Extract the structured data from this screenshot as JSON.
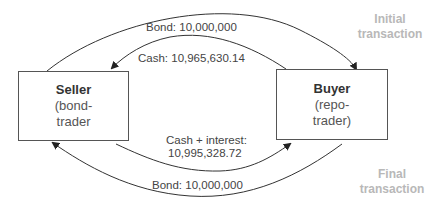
{
  "parties": {
    "seller": {
      "title": "Seller",
      "line1": "(bond-",
      "line2": "trader"
    },
    "buyer": {
      "title": "Buyer",
      "line1": "(repo-",
      "line2": "trader)"
    }
  },
  "initial_transaction": {
    "label_line1": "Initial",
    "label_line2": "transaction",
    "bond_flow": "Bond: 10,000,000",
    "cash_flow": "Cash: 10,965,630.14"
  },
  "final_transaction": {
    "label_line1": "Final",
    "label_line2": "transaction",
    "cash_flow_line1": "Cash + interest:",
    "cash_flow_line2": "10,995,328.72",
    "bond_flow": "Bond: 10,000,000"
  },
  "colors": {
    "line": "#333333",
    "phase_label": "#b8b8b8"
  }
}
